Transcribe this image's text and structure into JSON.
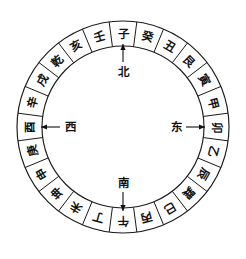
{
  "diagram": {
    "type": "compass-ring",
    "geometry": {
      "center_x": 123,
      "center_y": 127,
      "outer_radius": 106,
      "inner_radius": 81,
      "sector_count": 24,
      "sector_degrees": 15
    },
    "colors": {
      "line": "#1a1a1a",
      "text": "#111111",
      "background": "#ffffff"
    },
    "sectors": [
      {
        "index": 0,
        "label": "子",
        "angle_deg": 0
      },
      {
        "index": 1,
        "label": "癸",
        "angle_deg": 15
      },
      {
        "index": 2,
        "label": "丑",
        "angle_deg": 30
      },
      {
        "index": 3,
        "label": "艮",
        "angle_deg": 45
      },
      {
        "index": 4,
        "label": "寅",
        "angle_deg": 60
      },
      {
        "index": 5,
        "label": "甲",
        "angle_deg": 75
      },
      {
        "index": 6,
        "label": "卯",
        "angle_deg": 90
      },
      {
        "index": 7,
        "label": "乙",
        "angle_deg": 105
      },
      {
        "index": 8,
        "label": "辰",
        "angle_deg": 120
      },
      {
        "index": 9,
        "label": "巽",
        "angle_deg": 135
      },
      {
        "index": 10,
        "label": "巳",
        "angle_deg": 150
      },
      {
        "index": 11,
        "label": "丙",
        "angle_deg": 165
      },
      {
        "index": 12,
        "label": "午",
        "angle_deg": 180
      },
      {
        "index": 13,
        "label": "丁",
        "angle_deg": 195
      },
      {
        "index": 14,
        "label": "未",
        "angle_deg": 210
      },
      {
        "index": 15,
        "label": "坤",
        "angle_deg": 225
      },
      {
        "index": 16,
        "label": "申",
        "angle_deg": 240
      },
      {
        "index": 17,
        "label": "庚",
        "angle_deg": 255
      },
      {
        "index": 18,
        "label": "酉",
        "angle_deg": 270
      },
      {
        "index": 19,
        "label": "辛",
        "angle_deg": 285
      },
      {
        "index": 20,
        "label": "戌",
        "angle_deg": 300
      },
      {
        "index": 21,
        "label": "乾",
        "angle_deg": 315
      },
      {
        "index": 22,
        "label": "亥",
        "angle_deg": 330
      },
      {
        "index": 23,
        "label": "壬",
        "angle_deg": 345
      }
    ],
    "direction_markers": [
      {
        "key": "north",
        "label": "北",
        "points_to": "子",
        "label_x": 123,
        "label_y": 72,
        "arrow_from_x": 123,
        "arrow_from_y": 62,
        "arrow_to_x": 123,
        "arrow_to_y": 44,
        "orientation": "up"
      },
      {
        "key": "south",
        "label": "南",
        "points_to": "午",
        "label_x": 123,
        "label_y": 183,
        "arrow_from_x": 123,
        "arrow_from_y": 192,
        "arrow_to_x": 123,
        "arrow_to_y": 211,
        "orientation": "down"
      },
      {
        "key": "east",
        "label": "东",
        "points_to": "卯",
        "label_x": 176,
        "label_y": 127,
        "arrow_from_x": 186,
        "arrow_from_y": 127,
        "arrow_to_x": 205,
        "arrow_to_y": 127,
        "orientation": "right"
      },
      {
        "key": "west",
        "label": "西",
        "points_to": "酉",
        "label_x": 70,
        "label_y": 127,
        "arrow_from_x": 60,
        "arrow_from_y": 127,
        "arrow_to_x": 41,
        "arrow_to_y": 127,
        "orientation": "left"
      }
    ]
  }
}
